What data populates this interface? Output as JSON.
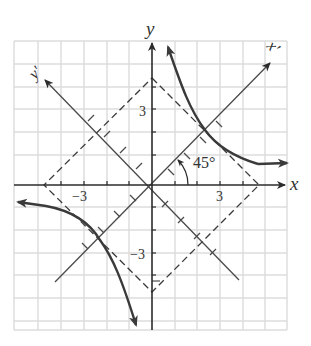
{
  "figure": {
    "type": "rotation-of-axes-diagram",
    "colors": {
      "grid": "#d9d9d9",
      "axis": "#2b2b2b",
      "rotated_axis": "#4a4a4a",
      "curve": "#3a3a3a",
      "dashed": "#3a3a3a",
      "background": "#ffffff"
    },
    "labels": {
      "x_axis": "x",
      "y_axis": "y",
      "x_prime": "x′",
      "y_prime": "y′",
      "angle": "45°",
      "tick_pos_x": "3",
      "tick_neg_x": "−3",
      "tick_pos_y": "3",
      "tick_neg_y": "−3"
    },
    "grid": {
      "x_min": -6,
      "x_max": 6,
      "y_min": -7,
      "y_max": 7,
      "step": 1
    },
    "rotation_angle_deg": 45
  }
}
